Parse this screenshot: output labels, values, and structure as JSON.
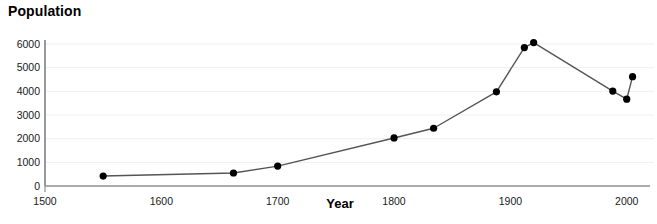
{
  "chart_data": {
    "type": "line",
    "title": "Population",
    "xlabel": "Year",
    "ylabel": "Population",
    "xlim": [
      1500,
      2020
    ],
    "ylim": [
      0,
      6400
    ],
    "grid": true,
    "legend": null,
    "marker": "filled-circle",
    "line_color": "#555555",
    "marker_color": "#000000",
    "axis_color": "#808080",
    "grid_color": "#f0f0f2",
    "xticks": [
      1500,
      1600,
      1700,
      1800,
      1900,
      2000
    ],
    "xtick_labels": [
      "1500",
      "1600",
      "1700",
      "1800",
      "1900",
      "2000"
    ],
    "yticks": [
      0,
      1000,
      2000,
      3000,
      4000,
      5000,
      6000
    ],
    "ytick_labels": [
      "0",
      "1000",
      "2000",
      "3000",
      "4000",
      "5000",
      "6000"
    ],
    "x": [
      1550,
      1662,
      1700,
      1800,
      1834,
      1888,
      1912,
      1920,
      1988,
      2000,
      2005
    ],
    "values": [
      420,
      550,
      840,
      2030,
      2440,
      3980,
      5850,
      6060,
      4010,
      3670,
      4620
    ],
    "points": [
      {
        "x": 1550,
        "y": 420
      },
      {
        "x": 1662,
        "y": 550
      },
      {
        "x": 1700,
        "y": 840
      },
      {
        "x": 1800,
        "y": 2030
      },
      {
        "x": 1834,
        "y": 2440
      },
      {
        "x": 1888,
        "y": 3980
      },
      {
        "x": 1912,
        "y": 5850
      },
      {
        "x": 1920,
        "y": 6060
      },
      {
        "x": 1988,
        "y": 4010
      },
      {
        "x": 2000,
        "y": 3670
      },
      {
        "x": 2005,
        "y": 4620
      }
    ]
  }
}
